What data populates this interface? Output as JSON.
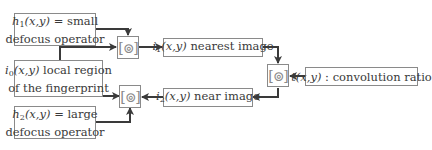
{
  "diagram": {
    "boxes": {
      "h1": {
        "var": "h",
        "sub": "1",
        "args": "(x,y)",
        "rest": " = small",
        "line2": "defocus operator"
      },
      "i0": {
        "var": "i",
        "sub": "0",
        "args": "(x,y)",
        "rest": " local region",
        "line2": "of the fingerprint"
      },
      "h2": {
        "var": "h",
        "sub": "2",
        "args": "(x,y)",
        "rest": " = large",
        "line2": "defocus operator"
      },
      "i1": {
        "var": "i",
        "sub": "1",
        "args": "(x,y)",
        "rest": " nearest image"
      },
      "i2": {
        "var": "i",
        "sub": "2",
        "args": "(x,y)",
        "rest": " near image"
      },
      "t": {
        "var": "t",
        "args": "(x,y)",
        "rest": " : convolution ratio"
      }
    },
    "operator_symbol": "[⊚]",
    "colors": {
      "line": "#3a3a3a",
      "border": "#8a8a8a",
      "text": "#3a3a3a"
    }
  }
}
